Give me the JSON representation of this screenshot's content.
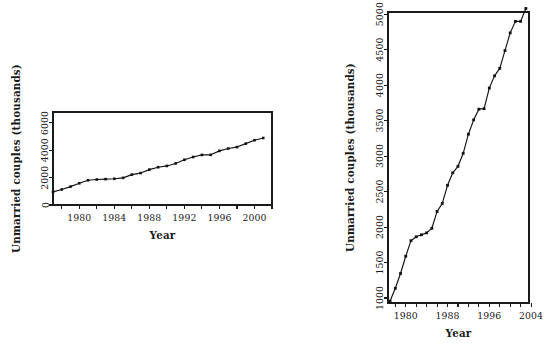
{
  "chart_data": [
    {
      "id": "left",
      "type": "line",
      "title": "",
      "xlabel": "Year",
      "ylabel": "Unmarried couples (thousands)",
      "xlim": [
        1977,
        2002
      ],
      "ylim": [
        0,
        6800
      ],
      "xticks": [
        1980,
        1984,
        1988,
        1992,
        1996,
        2000
      ],
      "xticklabels": [
        "1980",
        "1984",
        "1988",
        "1992",
        "1996",
        "2000"
      ],
      "xminorticks": [
        1978,
        1982,
        1986,
        1990,
        1994,
        1998,
        2002
      ],
      "yticks": [
        0,
        2000,
        4000,
        6000
      ],
      "yticklabels": [
        "0",
        "2000",
        "4000",
        "6000"
      ],
      "grid": false,
      "legend": "none",
      "markers": "filled-square",
      "x": [
        1977,
        1978,
        1979,
        1980,
        1981,
        1982,
        1983,
        1984,
        1985,
        1986,
        1987,
        1988,
        1989,
        1990,
        1991,
        1992,
        1993,
        1994,
        1995,
        1996,
        1997,
        1998,
        1999,
        2000,
        2001
      ],
      "values": [
        957,
        1137,
        1346,
        1589,
        1808,
        1863,
        1891,
        1918,
        1983,
        2220,
        2334,
        2588,
        2764,
        2856,
        3039,
        3308,
        3510,
        3661,
        3668,
        3958,
        4130,
        4236,
        4486,
        4736,
        4898
      ]
    },
    {
      "id": "right",
      "type": "line",
      "title": "",
      "xlabel": "Year",
      "ylabel": "Unmarried couples (thousands)",
      "xlim": [
        1976.6,
        2003.6
      ],
      "ylim": [
        930,
        5030
      ],
      "xticks": [
        1980,
        1988,
        1996,
        2004
      ],
      "xticklabels": [
        "1980",
        "1988",
        "1996",
        "2004"
      ],
      "xminorticks": [
        1978,
        1982,
        1984,
        1986,
        1990,
        1992,
        1994,
        1998,
        2000,
        2002
      ],
      "yticks": [
        1000,
        1500,
        2000,
        2500,
        3000,
        3500,
        4000,
        4500,
        5000
      ],
      "yticklabels": [
        "1000",
        "1500",
        "2000",
        "2500",
        "3000",
        "3500",
        "4000",
        "4500",
        "5000"
      ],
      "grid": false,
      "legend": "none",
      "markers": "filled-square",
      "x": [
        1977,
        1978,
        1979,
        1980,
        1981,
        1982,
        1983,
        1984,
        1985,
        1986,
        1987,
        1988,
        1989,
        1990,
        1991,
        1992,
        1993,
        1994,
        1995,
        1996,
        1997,
        1998,
        1999,
        2000,
        2001,
        2002,
        2003
      ],
      "values": [
        957,
        1137,
        1346,
        1589,
        1808,
        1863,
        1891,
        1918,
        1983,
        2220,
        2334,
        2588,
        2764,
        2856,
        3039,
        3308,
        3510,
        3661,
        3668,
        3958,
        4130,
        4236,
        4486,
        4736,
        4898,
        4898,
        5080
      ]
    }
  ],
  "panels": {
    "left": {
      "xlabel": "Year",
      "ylabel": "Unmarried couples (thousands)"
    },
    "right": {
      "xlabel": "Year",
      "ylabel": "Unmarried couples (thousands)"
    }
  },
  "colors": {
    "line": "#111111",
    "axis": "#1a1a1a",
    "background": "#ffffff"
  }
}
